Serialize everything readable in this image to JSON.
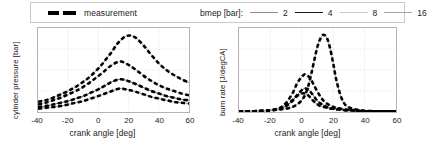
{
  "legend": {
    "measurement_label": "measurement",
    "bmep_title": "bmep [bar]:",
    "bmep_entries": [
      {
        "value": "2",
        "color": "#8c8c8c",
        "width": 1.3
      },
      {
        "value": "4",
        "color": "#1a1a1a",
        "width": 1.7
      },
      {
        "value": "8",
        "color": "#c4c4c4",
        "width": 1.1
      },
      {
        "value": "16",
        "color": "#a0a0a0",
        "width": 1.2
      }
    ],
    "measurement_color": "#000000"
  },
  "chart_data": [
    {
      "type": "line",
      "id": "cylinder-pressure",
      "title": "",
      "xlabel": "crank angle [deg]",
      "ylabel": "cylinder pressure [bar]",
      "xlim": [
        -40,
        60
      ],
      "ylim": [
        0,
        100
      ],
      "xticks": [
        -40,
        -20,
        0,
        20,
        40,
        60
      ],
      "yticks": [],
      "grid": true,
      "legend": "shared-top",
      "series": [
        {
          "name": "measurement bmep 2",
          "style": "dashed-thick",
          "color": "#000000",
          "x": [
            -40,
            -35,
            -30,
            -25,
            -20,
            -15,
            -10,
            -5,
            0,
            3,
            6,
            9,
            12,
            15,
            18,
            21,
            25,
            30,
            35,
            40,
            45,
            50,
            55,
            60
          ],
          "y": [
            4,
            5,
            6,
            7,
            9,
            11,
            13,
            16,
            19,
            21,
            23,
            25,
            27,
            28,
            27,
            26,
            24,
            21,
            18,
            16,
            14,
            12,
            11,
            10
          ]
        },
        {
          "name": "measurement bmep 4",
          "style": "dashed-thick",
          "color": "#000000",
          "x": [
            -40,
            -35,
            -30,
            -25,
            -20,
            -15,
            -10,
            -5,
            0,
            3,
            6,
            9,
            12,
            15,
            18,
            21,
            25,
            30,
            35,
            40,
            45,
            50,
            55,
            60
          ],
          "y": [
            6,
            7,
            9,
            11,
            13,
            16,
            19,
            23,
            27,
            30,
            33,
            36,
            38,
            39,
            38,
            36,
            33,
            29,
            25,
            22,
            19,
            17,
            15,
            14
          ]
        },
        {
          "name": "measurement bmep 8",
          "style": "dashed-thick",
          "color": "#000000",
          "x": [
            -40,
            -35,
            -30,
            -25,
            -20,
            -15,
            -10,
            -5,
            0,
            3,
            6,
            9,
            12,
            15,
            18,
            21,
            25,
            30,
            35,
            40,
            45,
            50,
            55,
            60
          ],
          "y": [
            9,
            11,
            14,
            17,
            21,
            25,
            30,
            36,
            43,
            47,
            52,
            56,
            59,
            60,
            58,
            55,
            50,
            43,
            37,
            32,
            28,
            25,
            22,
            20
          ]
        },
        {
          "name": "measurement bmep 16",
          "style": "dashed-thick",
          "color": "#000000",
          "x": [
            -40,
            -35,
            -30,
            -25,
            -20,
            -15,
            -10,
            -5,
            0,
            3,
            6,
            9,
            12,
            15,
            18,
            21,
            25,
            30,
            35,
            40,
            45,
            50,
            55,
            60
          ],
          "y": [
            12,
            14,
            17,
            21,
            25,
            30,
            36,
            43,
            52,
            58,
            65,
            72,
            80,
            86,
            90,
            91,
            88,
            79,
            68,
            58,
            50,
            44,
            39,
            35
          ]
        },
        {
          "name": "simulation bmep 2",
          "style": "solid-thin",
          "color": "#8c8c8c",
          "x": [
            -40,
            -35,
            -30,
            -25,
            -20,
            -15,
            -10,
            -5,
            0,
            3,
            6,
            9,
            12,
            15,
            18,
            21,
            25,
            30,
            35,
            40,
            45,
            50,
            55,
            60
          ],
          "y": [
            4,
            5,
            6,
            7,
            9,
            11,
            13,
            16,
            19,
            21,
            23,
            25,
            27,
            28,
            27,
            26,
            24,
            21,
            18,
            16,
            14,
            12,
            11,
            10
          ]
        },
        {
          "name": "simulation bmep 4",
          "style": "solid-thin",
          "color": "#5a5a5a",
          "x": [
            -40,
            -35,
            -30,
            -25,
            -20,
            -15,
            -10,
            -5,
            0,
            3,
            6,
            9,
            12,
            15,
            18,
            21,
            25,
            30,
            35,
            40,
            45,
            50,
            55,
            60
          ],
          "y": [
            6,
            7,
            9,
            11,
            13,
            16,
            19,
            23,
            27,
            30,
            33,
            36,
            38,
            39,
            38,
            36,
            33,
            29,
            25,
            22,
            19,
            17,
            15,
            14
          ]
        },
        {
          "name": "simulation bmep 8",
          "style": "solid-thin",
          "color": "#b0b0b0",
          "x": [
            -40,
            -35,
            -30,
            -25,
            -20,
            -15,
            -10,
            -5,
            0,
            3,
            6,
            9,
            12,
            15,
            18,
            21,
            25,
            30,
            35,
            40,
            45,
            50,
            55,
            60
          ],
          "y": [
            9,
            11,
            14,
            17,
            21,
            25,
            30,
            36,
            43,
            47,
            52,
            56,
            59,
            60,
            58,
            55,
            50,
            43,
            37,
            32,
            28,
            25,
            22,
            20
          ]
        },
        {
          "name": "simulation bmep 16",
          "style": "solid-thin",
          "color": "#9a9a9a",
          "x": [
            -40,
            -35,
            -30,
            -25,
            -20,
            -15,
            -10,
            -5,
            0,
            3,
            6,
            9,
            12,
            15,
            18,
            21,
            25,
            30,
            35,
            40,
            45,
            50,
            55,
            60
          ],
          "y": [
            12,
            14,
            17,
            21,
            25,
            30,
            36,
            43,
            52,
            58,
            65,
            72,
            80,
            86,
            90,
            91,
            88,
            79,
            68,
            58,
            50,
            44,
            39,
            35
          ]
        }
      ]
    },
    {
      "type": "line",
      "id": "burn-rate",
      "title": "",
      "xlabel": "crank angle [deg]",
      "ylabel": "burn rate [J/degCA]",
      "xlim": [
        -40,
        60
      ],
      "ylim": [
        0,
        100
      ],
      "xticks": [
        -40,
        -20,
        0,
        20,
        40,
        60
      ],
      "yticks": [],
      "grid": true,
      "legend": "shared-top",
      "series": [
        {
          "name": "measurement bmep 2",
          "style": "dashed-thick",
          "color": "#000000",
          "x": [
            -40,
            -30,
            -20,
            -14,
            -10,
            -6,
            -3,
            0,
            2,
            4,
            6,
            8,
            10,
            12,
            14,
            16,
            18,
            20,
            22,
            25,
            28,
            32,
            38,
            45,
            52,
            60
          ],
          "y": [
            1,
            1,
            2,
            4,
            8,
            14,
            19,
            22,
            22,
            20,
            16,
            12,
            9,
            7,
            6,
            5,
            4,
            4,
            3,
            3,
            2,
            2,
            1,
            1,
            1,
            1
          ]
        },
        {
          "name": "measurement bmep 4",
          "style": "dashed-thick",
          "color": "#000000",
          "x": [
            -40,
            -30,
            -20,
            -14,
            -10,
            -6,
            -3,
            0,
            2,
            4,
            6,
            8,
            10,
            12,
            14,
            16,
            18,
            20,
            22,
            25,
            28,
            32,
            38,
            45,
            52,
            60
          ],
          "y": [
            1,
            1,
            2,
            4,
            7,
            13,
            20,
            26,
            28,
            27,
            23,
            18,
            13,
            10,
            8,
            6,
            5,
            4,
            4,
            3,
            2,
            2,
            1,
            1,
            1,
            1
          ]
        },
        {
          "name": "measurement bmep 8",
          "style": "dashed-thick",
          "color": "#000000",
          "x": [
            -40,
            -30,
            -20,
            -14,
            -10,
            -6,
            -3,
            0,
            2,
            4,
            6,
            8,
            10,
            12,
            14,
            16,
            18,
            20,
            22,
            25,
            28,
            32,
            38,
            45,
            52,
            60
          ],
          "y": [
            1,
            1,
            2,
            5,
            11,
            22,
            34,
            42,
            45,
            43,
            38,
            31,
            24,
            18,
            13,
            10,
            8,
            6,
            5,
            4,
            3,
            2,
            1,
            1,
            1,
            1
          ]
        },
        {
          "name": "measurement bmep 16",
          "style": "dashed-thick",
          "color": "#000000",
          "x": [
            -40,
            -30,
            -20,
            -14,
            -10,
            -6,
            -3,
            0,
            2,
            4,
            6,
            8,
            10,
            12,
            14,
            16,
            18,
            20,
            22,
            25,
            28,
            32,
            38,
            45,
            52,
            60
          ],
          "y": [
            1,
            1,
            2,
            3,
            4,
            6,
            9,
            14,
            20,
            30,
            45,
            62,
            78,
            88,
            92,
            88,
            76,
            58,
            38,
            18,
            8,
            4,
            2,
            1,
            1,
            1
          ]
        },
        {
          "name": "simulation bmep 2",
          "style": "solid-thin",
          "color": "#8c8c8c",
          "x": [
            -40,
            -30,
            -20,
            -14,
            -10,
            -6,
            -3,
            0,
            2,
            4,
            6,
            8,
            10,
            12,
            14,
            16,
            18,
            20,
            22,
            25,
            28,
            32,
            38,
            45,
            52,
            60
          ],
          "y": [
            1,
            1,
            2,
            4,
            8,
            14,
            19,
            22,
            22,
            20,
            16,
            12,
            9,
            7,
            6,
            5,
            4,
            4,
            3,
            3,
            2,
            2,
            1,
            1,
            1,
            1
          ]
        },
        {
          "name": "simulation bmep 4",
          "style": "solid-thin",
          "color": "#5a5a5a",
          "x": [
            -40,
            -30,
            -20,
            -14,
            -10,
            -6,
            -3,
            0,
            2,
            4,
            6,
            8,
            10,
            12,
            14,
            16,
            18,
            20,
            22,
            25,
            28,
            32,
            38,
            45,
            52,
            60
          ],
          "y": [
            1,
            1,
            2,
            4,
            7,
            13,
            20,
            26,
            28,
            27,
            23,
            18,
            13,
            10,
            8,
            6,
            5,
            4,
            4,
            3,
            2,
            2,
            1,
            1,
            1,
            1
          ]
        },
        {
          "name": "simulation bmep 8",
          "style": "solid-thin",
          "color": "#b0b0b0",
          "x": [
            -40,
            -30,
            -20,
            -14,
            -10,
            -6,
            -3,
            0,
            2,
            4,
            6,
            8,
            10,
            12,
            14,
            16,
            18,
            20,
            22,
            25,
            28,
            32,
            38,
            45,
            52,
            60
          ],
          "y": [
            1,
            1,
            2,
            5,
            11,
            22,
            34,
            42,
            45,
            43,
            38,
            31,
            24,
            18,
            13,
            10,
            8,
            6,
            5,
            4,
            3,
            2,
            1,
            1,
            1,
            1
          ]
        },
        {
          "name": "simulation bmep 16",
          "style": "solid-thin",
          "color": "#9a9a9a",
          "x": [
            -40,
            -30,
            -20,
            -14,
            -10,
            -6,
            -3,
            0,
            2,
            4,
            6,
            8,
            10,
            12,
            14,
            16,
            18,
            20,
            22,
            25,
            28,
            32,
            38,
            45,
            52,
            60
          ],
          "y": [
            1,
            1,
            2,
            3,
            4,
            6,
            9,
            14,
            20,
            30,
            45,
            62,
            78,
            88,
            92,
            88,
            76,
            58,
            38,
            18,
            8,
            4,
            2,
            1,
            1,
            1
          ]
        }
      ]
    }
  ]
}
